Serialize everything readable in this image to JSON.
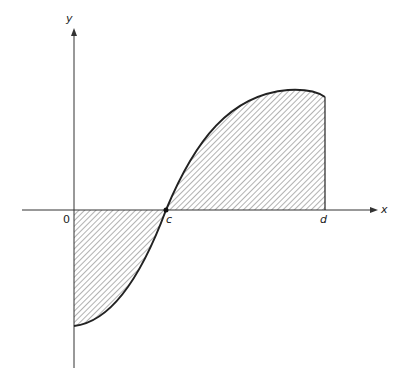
{
  "diagram": {
    "type": "area-under-curve",
    "labels": {
      "y_axis": "y",
      "x_axis": "x",
      "origin": "0",
      "root": "c",
      "endpoint": "d"
    },
    "colors": {
      "stroke": "#222222",
      "hatch": "#555555",
      "background": "#ffffff"
    },
    "regions": [
      {
        "name": "below-axis",
        "from": "0",
        "to": "c",
        "sign": "negative"
      },
      {
        "name": "above-axis",
        "from": "c",
        "to": "d",
        "sign": "positive"
      }
    ]
  }
}
